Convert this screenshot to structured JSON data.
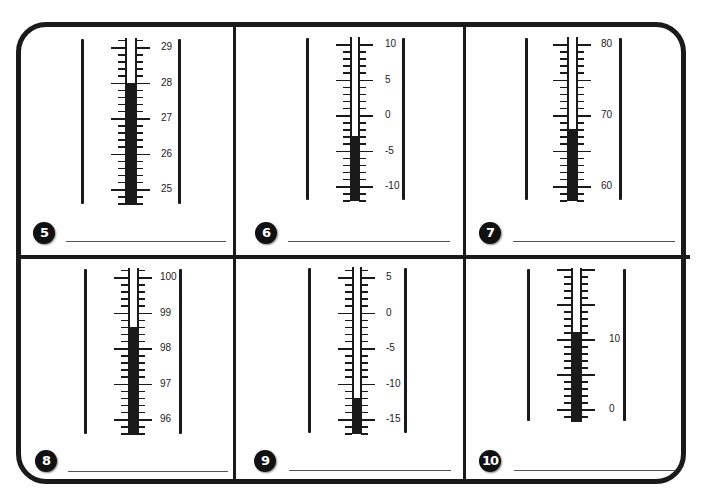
{
  "worksheet": {
    "problems": [
      {
        "number": "5",
        "labels": [
          {
            "text": "29",
            "value": 29
          },
          {
            "text": "28",
            "value": 28
          },
          {
            "text": "27",
            "value": 27
          },
          {
            "text": "26",
            "value": 26
          },
          {
            "text": "25",
            "value": 25
          }
        ],
        "major_step": 1,
        "minor_divisions": 5,
        "scale_top": 29,
        "scale_bottom": 25,
        "reading": 28,
        "answer": ""
      },
      {
        "number": "6",
        "labels": [
          {
            "text": "10",
            "value": 10
          },
          {
            "text": "5",
            "value": 5
          },
          {
            "text": "0",
            "value": 0
          },
          {
            "text": "-5",
            "value": -5
          },
          {
            "text": "-10",
            "value": -10
          }
        ],
        "major_step": 5,
        "minor_divisions": 5,
        "scale_top": 10,
        "scale_bottom": -10,
        "reading": -3,
        "answer": ""
      },
      {
        "number": "7",
        "labels": [
          {
            "text": "80",
            "value": 80
          },
          {
            "text": "70",
            "value": 70
          },
          {
            "text": "60",
            "value": 60
          }
        ],
        "major_step": 5,
        "minor_divisions": 5,
        "scale_top": 80,
        "scale_bottom": 60,
        "reading": 68,
        "answer": ""
      },
      {
        "number": "8",
        "labels": [
          {
            "text": "100",
            "value": 100
          },
          {
            "text": "99",
            "value": 99
          },
          {
            "text": "98",
            "value": 98
          },
          {
            "text": "97",
            "value": 97
          },
          {
            "text": "96",
            "value": 96
          }
        ],
        "major_step": 1,
        "minor_divisions": 5,
        "scale_top": 100,
        "scale_bottom": 96,
        "reading": 98.6,
        "answer": ""
      },
      {
        "number": "9",
        "labels": [
          {
            "text": "5",
            "value": 5
          },
          {
            "text": "0",
            "value": 0
          },
          {
            "text": "-5",
            "value": -5
          },
          {
            "text": "-10",
            "value": -10
          },
          {
            "text": "-15",
            "value": -15
          }
        ],
        "major_step": 5,
        "minor_divisions": 5,
        "scale_top": 5,
        "scale_bottom": -15,
        "reading": -12,
        "answer": ""
      },
      {
        "number": "10",
        "labels": [
          {
            "text": "10",
            "value": 10
          },
          {
            "text": "0",
            "value": 0
          }
        ],
        "major_step": 5,
        "minor_divisions": 5,
        "scale_top": 20,
        "scale_bottom": 0,
        "reading": 11,
        "answer": ""
      }
    ]
  }
}
